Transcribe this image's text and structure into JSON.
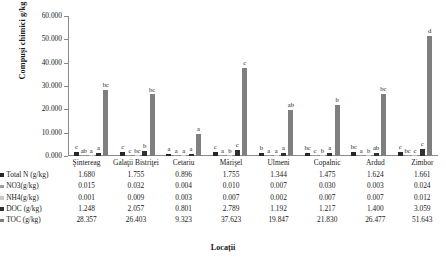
{
  "chart_data": {
    "type": "bar",
    "title": "",
    "xlabel": "Locații",
    "ylabel": "Compuşi chimici g/kg",
    "ylim": [
      0,
      60
    ],
    "ytick_labels": [
      "60.000",
      "50.000",
      "40.000",
      "30.000",
      "20.000",
      "10.000",
      "0.000"
    ],
    "ytick_values": [
      60,
      50,
      40,
      30,
      20,
      10,
      0
    ],
    "grid": false,
    "legend_position": "table-left",
    "categories": [
      "Şintereag",
      "Galaţii Bistriţei",
      "Cetariu",
      "Mărişel",
      "Ulmeni",
      "Copalnic",
      "Ardud",
      "Zimbor"
    ],
    "series": [
      {
        "name": "Total N (g/kg)",
        "color": "#262626",
        "values": [
          1.68,
          1.755,
          0.896,
          1.755,
          1.344,
          1.475,
          1.624,
          1.661
        ],
        "letters": [
          "c",
          "c",
          "a",
          "c",
          "b",
          "bc",
          "bc",
          "c"
        ]
      },
      {
        "name": "NO3(g/kg)",
        "color": "#9c9c9c",
        "values": [
          0.015,
          0.032,
          0.004,
          0.01,
          0.007,
          0.03,
          0.003,
          0.024
        ],
        "letters": [
          "ab",
          "c",
          "a",
          "a",
          "a",
          "c",
          "a",
          "bc"
        ]
      },
      {
        "name": "NH4(g/kg)",
        "color": "#c8c8c8",
        "values": [
          0.001,
          0.009,
          0.003,
          0.007,
          0.002,
          0.007,
          0.007,
          0.012
        ],
        "letters": [
          "a",
          "bc",
          "a",
          "b",
          "a",
          "b",
          "b",
          "c"
        ]
      },
      {
        "name": "DOC (g/kg)",
        "color": "#303030",
        "values": [
          1.248,
          2.057,
          0.801,
          2.789,
          1.192,
          1.217,
          1.4,
          3.059
        ],
        "letters": [
          "a",
          "b",
          "a",
          "c",
          "a",
          "a",
          "ab",
          "c"
        ]
      },
      {
        "name": "TOC (g/kg)",
        "color": "#7f7f7f",
        "values": [
          28.357,
          26.403,
          9.323,
          37.623,
          19.847,
          21.83,
          26.477,
          51.643
        ],
        "letters": [
          "bc",
          "bc",
          "a",
          "c",
          "ab",
          "b",
          "bc",
          "d"
        ]
      }
    ]
  },
  "table": {
    "row_labels": [
      "Total N (g/kg)",
      "NO3(g/kg)",
      "NH4(g/kg)",
      "DOC (g/kg)",
      "TOC (g/kg)"
    ],
    "columns": [
      "Şintereag",
      "Galaţii Bistriţei",
      "Cetariu",
      "Mărişel",
      "Ulmeni",
      "Copalnic",
      "Ardud",
      "Zimbor"
    ],
    "rows": [
      [
        "1.680",
        "1.755",
        "0.896",
        "1.755",
        "1.344",
        "1.475",
        "1.624",
        "1.661"
      ],
      [
        "0.015",
        "0.032",
        "0.004",
        "0.010",
        "0.007",
        "0.030",
        "0.003",
        "0.024"
      ],
      [
        "0.001",
        "0.009",
        "0.003",
        "0.007",
        "0.002",
        "0.007",
        "0.007",
        "0.012"
      ],
      [
        "1.248",
        "2.057",
        "0.801",
        "2.789",
        "1.192",
        "1.217",
        "1.400",
        "3.059"
      ],
      [
        "28.357",
        "26.403",
        "9.323",
        "37.623",
        "19.847",
        "21.830",
        "26.477",
        "51.643"
      ]
    ]
  }
}
